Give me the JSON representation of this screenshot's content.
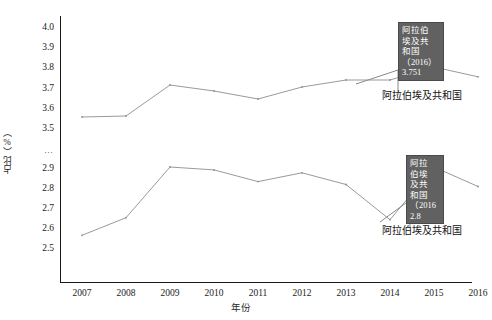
{
  "chart_data": {
    "type": "line",
    "title": "",
    "xlabel": "年份",
    "ylabel": "占比（%）",
    "x": [
      2007,
      2008,
      2009,
      2010,
      2011,
      2012,
      2013,
      2014,
      2015,
      2016
    ],
    "categories": [
      "2007",
      "2008",
      "2009",
      "2010",
      "2011",
      "2012",
      "2013",
      "2014",
      "2015",
      "2016"
    ],
    "y_tick_labels": [
      "4.0",
      "3.9",
      "3.8",
      "3.7",
      "3.6",
      "3.5",
      "…",
      "2.9",
      "2.8",
      "2.7",
      "2.6",
      "2.5"
    ],
    "y_axis_break": true,
    "y_axis_break_note": "Axis is broken between 3.5 and 2.9; the '…' tick marks the discontinuity.",
    "grid": false,
    "legend_position": "inline-right",
    "series": [
      {
        "name": "阿拉伯埃及共和国",
        "segment": "upper",
        "values": [
          3.55,
          3.555,
          3.71,
          3.68,
          3.64,
          3.7,
          3.735,
          3.735,
          3.8,
          3.751
        ]
      },
      {
        "name": "阿拉伯埃及共和国",
        "segment": "lower",
        "values": [
          2.55,
          2.64,
          2.9,
          2.885,
          2.825,
          2.87,
          2.81,
          2.63,
          2.9,
          2.8
        ]
      }
    ],
    "annotations": [
      {
        "id": "tooltip-upper",
        "lines": [
          "阿拉伯",
          "埃及共",
          "和国",
          "（2016）",
          "3.751"
        ],
        "country": "阿拉伯埃及共和国",
        "year": "2016",
        "value": "3.751"
      },
      {
        "id": "tooltip-lower",
        "lines": [
          "阿拉",
          "伯埃",
          "及共",
          "和国",
          "（2016",
          "2.8"
        ],
        "country": "阿拉伯埃及共和国",
        "year": "2016",
        "value": "2.8"
      }
    ],
    "series_labels": [
      {
        "id": "series-label-upper",
        "text": "阿拉伯埃及共和国"
      },
      {
        "id": "series-label-lower",
        "text": "阿拉伯埃及共和国"
      }
    ],
    "colors": {
      "line": "#9a9a9a",
      "axis": "#1a1a1a",
      "tooltip_background": "#616161",
      "tooltip_text": "#ffffff",
      "text": "#1a1a1a"
    }
  }
}
